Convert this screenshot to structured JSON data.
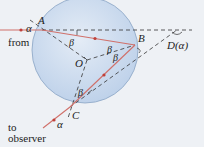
{
  "diagram": {
    "labels": {
      "from_line1": "from",
      "from_line2": "Sun",
      "to_line1": "to",
      "to_line2": "observer",
      "point_a": "A",
      "point_b": "B",
      "point_c": "C",
      "point_o": "O",
      "point_d": "D(α)",
      "alpha_in": "α",
      "alpha_out": "α",
      "beta_a": "β",
      "beta_b1": "β",
      "beta_b2": "β",
      "beta_c": "β"
    },
    "colors": {
      "background": "#eef1f5",
      "droplet_fill": "#c9daee",
      "droplet_stroke": "#8aa4c4",
      "ray": "#d0706a",
      "dashed": "#333333"
    }
  }
}
